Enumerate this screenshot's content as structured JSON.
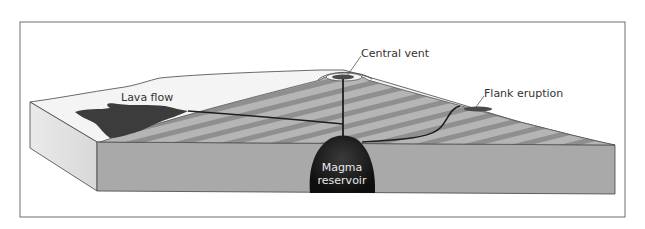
{
  "figure": {
    "labels": {
      "lava_flow": "Lava flow",
      "central_vent": "Central vent",
      "flank_eruption": "Flank eruption",
      "magma_line1": "Magma",
      "magma_line2": "reservoir"
    },
    "colors": {
      "frame": "#6f6f6f",
      "ground_top": "#f4f4f4",
      "side_face": "#e4e4e4",
      "front_face": "#a9a9a9",
      "cone_light": "#b3b3b3",
      "cone_dark": "#8e8e8e",
      "lava": "#3c3c3c",
      "magma": "#1a1a1a",
      "conduit": "#1e1e1e"
    }
  }
}
